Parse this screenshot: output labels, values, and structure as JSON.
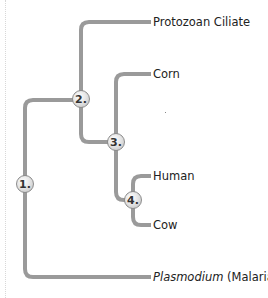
{
  "diagram": {
    "type": "phylogenetic-tree",
    "line_color": "#9a9a9a",
    "nodes": [
      {
        "id": "1",
        "label": "1."
      },
      {
        "id": "2",
        "label": "2."
      },
      {
        "id": "3",
        "label": "3."
      },
      {
        "id": "4",
        "label": "4."
      }
    ],
    "leaves": [
      {
        "id": "protozoan",
        "label": "Protozoan Ciliate"
      },
      {
        "id": "corn",
        "label": "Corn"
      },
      {
        "id": "human",
        "label": "Human"
      },
      {
        "id": "cow",
        "label": "Cow"
      },
      {
        "id": "plasmodium",
        "label_italic": "Plasmodium",
        "label_rest": " (Malaria)"
      }
    ],
    "edges": [
      [
        "1",
        "2"
      ],
      [
        "1",
        "plasmodium"
      ],
      [
        "2",
        "protozoan"
      ],
      [
        "2",
        "3"
      ],
      [
        "3",
        "corn"
      ],
      [
        "3",
        "4"
      ],
      [
        "4",
        "human"
      ],
      [
        "4",
        "cow"
      ]
    ]
  }
}
